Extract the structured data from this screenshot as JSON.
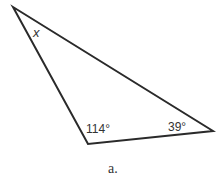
{
  "figure": {
    "caption": "a.",
    "triangle": {
      "vertices": {
        "top": [
          13,
          7
        ],
        "bottom_left": [
          88,
          144
        ],
        "right": [
          213,
          131
        ]
      },
      "stroke_color": "#2a2a2a"
    },
    "angles": [
      {
        "vertex": "top",
        "label": "x"
      },
      {
        "vertex": "bottom_left",
        "label": "114°"
      },
      {
        "vertex": "right",
        "label": "39°"
      }
    ]
  }
}
